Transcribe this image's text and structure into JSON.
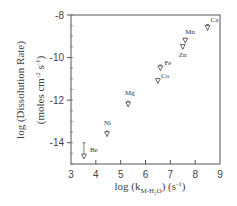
{
  "chart_data": {
    "type": "scatter",
    "title": "",
    "xlabel": "log (k_M-H2O) (s^-1)",
    "xlabel_parts": {
      "main": "log (k",
      "sub": "M-H",
      "sub2": "2",
      "sub3": "O",
      "close": ")",
      "unit": " (s",
      "sup": "-1",
      "unit_close": ")"
    },
    "ylabel": "log (Dissolution Rate) (moles cm^-2 s^-1)",
    "ylabel_line1": "log (Dissolution Rate)",
    "ylabel_line2_parts": {
      "a": "(moles cm",
      "sup1": "-2",
      "b": " s",
      "sup2": "-1",
      "c": ")"
    },
    "xlim": [
      3,
      9
    ],
    "ylim": [
      -15,
      -8
    ],
    "xticks": [
      3,
      4,
      5,
      6,
      7,
      8,
      9
    ],
    "yticks": [
      -8,
      -10,
      -12,
      -14
    ],
    "grid": false,
    "legend": null,
    "marker": "down-triangle",
    "points": [
      {
        "label": "Be",
        "x": 3.52,
        "y": -14.65,
        "err_high": -14.0,
        "err_low": -14.7,
        "label_dx": 6,
        "label_dy": -5
      },
      {
        "label": "Ni",
        "x": 4.45,
        "y": -13.6,
        "err_high": -13.45,
        "err_low": -13.7,
        "label_dx": -3,
        "label_dy": -9
      },
      {
        "label": "Mg",
        "x": 5.3,
        "y": -12.2,
        "err_high": -12.05,
        "err_low": -12.3,
        "label_dx": -3,
        "label_dy": -9
      },
      {
        "label": "Co",
        "x": 6.5,
        "y": -11.1,
        "err_high": -11.0,
        "err_low": -11.2,
        "label_dx": 3,
        "label_dy": -3
      },
      {
        "label": "Fe",
        "x": 6.6,
        "y": -10.5,
        "err_high": -10.35,
        "err_low": -10.6,
        "label_dx": 4,
        "label_dy": -3
      },
      {
        "label": "Zn",
        "x": 7.5,
        "y": -9.5,
        "err_high": -9.4,
        "err_low": -9.6,
        "label_dx": -4,
        "label_dy": 10
      },
      {
        "label": "Mn",
        "x": 7.6,
        "y": -9.2,
        "err_high": -9.1,
        "err_low": -9.3,
        "label_dx": 0,
        "label_dy": -7
      },
      {
        "label": "Ca",
        "x": 8.5,
        "y": -8.6,
        "err_high": -8.45,
        "err_low": -8.75,
        "label_dx": 3,
        "label_dy": -6
      }
    ]
  },
  "colors": {
    "axis": "#555555",
    "marker": "#444444",
    "text": "#444444",
    "background": "#ffffff"
  }
}
